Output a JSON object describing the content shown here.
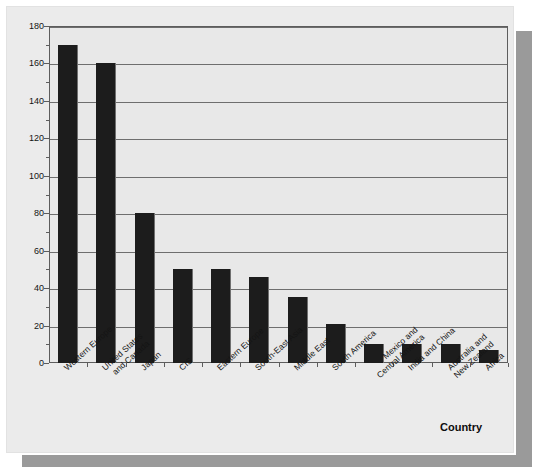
{
  "chart_data": {
    "type": "bar",
    "title": "",
    "subtitle": "",
    "xlabel": "Country",
    "ylabel": "",
    "ylim": [
      0,
      180
    ],
    "ytick_step": 20,
    "yticks": [
      0,
      20,
      40,
      60,
      80,
      100,
      120,
      140,
      160,
      180
    ],
    "ytick_labels": [
      "0",
      "20",
      "40",
      "60",
      "80",
      "100",
      "120",
      "140",
      "160",
      "180"
    ],
    "grid": "horizontal",
    "legend": "none",
    "orientation": "vertical",
    "bar_color": "#1c1c1c",
    "plot_background": "#e8e8e8",
    "page_background": "#ebebeb",
    "axis_color": "#5d5d5d",
    "categories": [
      "Western Europe",
      "United States and Canada",
      "Japan",
      "CIS",
      "Eastern Europe",
      "South-East Asia",
      "Middle East",
      "South America",
      "Mexico and Central America",
      "India and China",
      "Australia and New Zealand",
      "Africa"
    ],
    "category_lines": [
      [
        "Western Europe"
      ],
      [
        "United States",
        "and Canada"
      ],
      [
        "Japan"
      ],
      [
        "CIS"
      ],
      [
        "Eastern Europe"
      ],
      [
        "South-East Asia"
      ],
      [
        "Middle East"
      ],
      [
        "South America"
      ],
      [
        "Mexico and",
        "Central America"
      ],
      [
        "India and China"
      ],
      [
        "Australia and",
        "New Zealand"
      ],
      [
        "Africa"
      ]
    ],
    "values": [
      170,
      160,
      80,
      50,
      50,
      46,
      35,
      21,
      10,
      10,
      10,
      7
    ]
  }
}
